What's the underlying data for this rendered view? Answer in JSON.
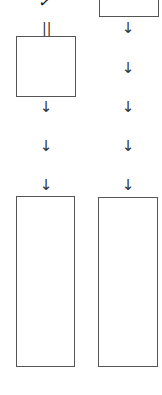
{
  "diagram": {
    "top_mark": "✓",
    "equals_mark": "||",
    "arrow_glyph": "↓",
    "left_column": {
      "arrows": [
        "↓",
        "↓",
        "↓"
      ]
    },
    "right_column": {
      "arrows": [
        "↓",
        "↓",
        "↓",
        "↓",
        "↓"
      ]
    },
    "colors": {
      "box_border": "#555555",
      "arrow": "#333333",
      "background": "#ffffff"
    }
  }
}
